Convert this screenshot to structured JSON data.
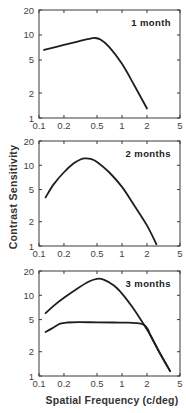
{
  "figure": {
    "ylabel": "Contrast Sensitivity",
    "xlabel": "Spatial Frequency  (c/deg)"
  },
  "chart_data": [
    {
      "type": "line",
      "title": "1 month",
      "xlabel": "Spatial Frequency (c/deg)",
      "ylabel": "Contrast Sensitivity",
      "xscale": "log",
      "yscale": "log",
      "xlim": [
        0.1,
        5
      ],
      "ylim": [
        1,
        20
      ],
      "xticks": [
        0.1,
        0.2,
        0.5,
        1,
        2,
        5
      ],
      "xtick_labels": [
        "0.1",
        "0.2",
        "0.5",
        "1",
        "2",
        "5"
      ],
      "yticks": [
        1,
        2,
        5,
        10,
        20
      ],
      "ytick_labels": [
        "1",
        "2",
        "5",
        "10",
        "20"
      ],
      "grid": false,
      "series": [
        {
          "name": "1 month",
          "x": [
            0.115,
            0.2,
            0.3,
            0.4,
            0.47,
            0.55,
            0.7,
            1.0,
            1.4,
            2.0
          ],
          "y": [
            6.6,
            7.6,
            8.4,
            9.0,
            9.2,
            8.8,
            7.2,
            4.5,
            2.5,
            1.3
          ]
        }
      ]
    },
    {
      "type": "line",
      "title": "2 months",
      "xlabel": "Spatial Frequency (c/deg)",
      "ylabel": "Contrast Sensitivity",
      "xscale": "log",
      "yscale": "log",
      "xlim": [
        0.1,
        5
      ],
      "ylim": [
        1,
        20
      ],
      "xticks": [
        0.1,
        0.2,
        0.5,
        1,
        2,
        5
      ],
      "xtick_labels": [
        "0.1",
        "0.2",
        "0.5",
        "1",
        "2",
        "5"
      ],
      "yticks": [
        1,
        2,
        5,
        10,
        20
      ],
      "ytick_labels": [
        "1",
        "2",
        "5",
        "10",
        "20"
      ],
      "grid": false,
      "series": [
        {
          "name": "2 months",
          "x": [
            0.12,
            0.15,
            0.2,
            0.26,
            0.32,
            0.36,
            0.42,
            0.5,
            0.7,
            1.0,
            1.4,
            2.0,
            2.6
          ],
          "y": [
            4.0,
            5.8,
            8.2,
            10.5,
            11.9,
            12.2,
            12.0,
            11.0,
            8.2,
            5.4,
            3.2,
            1.8,
            1.05
          ]
        }
      ]
    },
    {
      "type": "line",
      "title": "3 months",
      "xlabel": "Spatial Frequency (c/deg)",
      "ylabel": "Contrast Sensitivity",
      "xscale": "log",
      "yscale": "log",
      "xlim": [
        0.1,
        5
      ],
      "ylim": [
        1,
        20
      ],
      "xticks": [
        0.1,
        0.2,
        0.5,
        1,
        2,
        5
      ],
      "xtick_labels": [
        "0.1",
        "0.2",
        "0.5",
        "1",
        "2",
        "5"
      ],
      "yticks": [
        1,
        2,
        5,
        10,
        20
      ],
      "ytick_labels": [
        "1",
        "2",
        "5",
        "10",
        "20"
      ],
      "grid": false,
      "series": [
        {
          "name": "upper curve",
          "x": [
            0.12,
            0.15,
            0.2,
            0.3,
            0.4,
            0.5,
            0.6,
            0.8,
            1.0,
            1.3,
            1.7,
            2.2,
            2.8,
            3.8
          ],
          "y": [
            6.0,
            7.4,
            9.3,
            12.4,
            14.8,
            16.0,
            15.6,
            13.2,
            10.5,
            7.4,
            4.9,
            3.2,
            2.0,
            1.15
          ]
        },
        {
          "name": "lower curve",
          "x": [
            0.12,
            0.15,
            0.18,
            0.22,
            0.3,
            0.5,
            0.8,
            1.2,
            1.6,
            1.85,
            2.05,
            2.2,
            2.8,
            3.8
          ],
          "y": [
            3.5,
            4.0,
            4.45,
            4.6,
            4.65,
            4.62,
            4.6,
            4.58,
            4.5,
            4.3,
            3.8,
            3.2,
            2.0,
            1.15
          ]
        }
      ]
    }
  ]
}
